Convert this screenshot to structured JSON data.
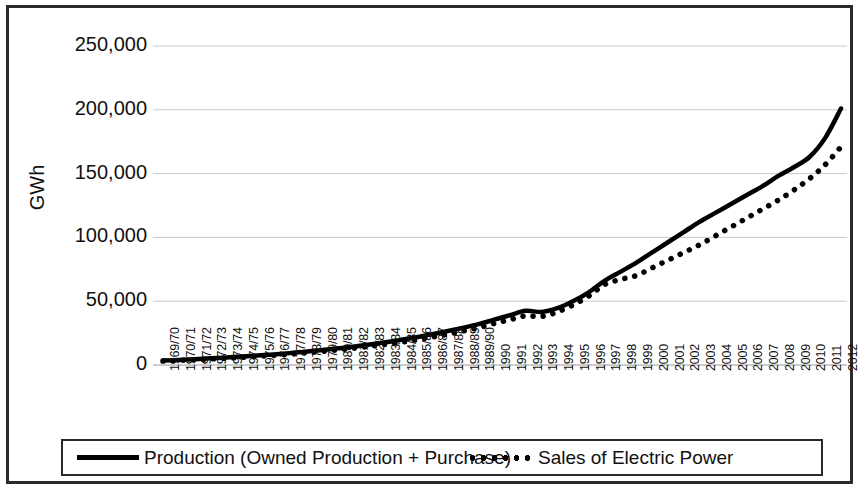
{
  "chart_data": {
    "type": "line",
    "title": "",
    "xlabel": "",
    "ylabel": "GWh",
    "ylim": [
      0,
      250000
    ],
    "yticks": [
      0,
      50000,
      100000,
      150000,
      200000,
      250000
    ],
    "ytick_labels": [
      "0",
      "50,000",
      "100,000",
      "150,000",
      "200,000",
      "250,000"
    ],
    "grid": true,
    "legend_position": "bottom",
    "categories": [
      "1969/70",
      "1970/71",
      "1971/72",
      "1972/73",
      "1973/74",
      "1974/75",
      "1975/76",
      "1976/77",
      "1977/78",
      "1978/79",
      "1979/80",
      "1980/81",
      "1981/82",
      "1982/83",
      "1983/84",
      "1984/85",
      "1985/86",
      "1986/87",
      "1987/88",
      "1988/89",
      "1989/90",
      "1990",
      "1991",
      "1992",
      "1993",
      "1994",
      "1995",
      "1996",
      "1997",
      "1998",
      "1999",
      "2000",
      "2001",
      "2002",
      "2003",
      "2004",
      "2005",
      "2006",
      "2007",
      "2008",
      "2009",
      "2010",
      "2011",
      "2012"
    ],
    "series": [
      {
        "name": "Production (Owned Production + Purchase)",
        "style": "solid",
        "color": "#000000",
        "values": [
          3500,
          4000,
          4600,
          5200,
          5900,
          6600,
          7400,
          8300,
          9300,
          10400,
          11600,
          12900,
          14300,
          15900,
          17600,
          19500,
          21600,
          23900,
          26400,
          29100,
          32000,
          35500,
          39000,
          42500,
          41500,
          44500,
          50000,
          57000,
          66000,
          73000,
          80000,
          88000,
          96000,
          104000,
          112000,
          119000,
          126000,
          133000,
          140000,
          148000,
          155000,
          163000,
          178000,
          201000
        ]
      },
      {
        "name": "Sales of Electric Power",
        "style": "dotted",
        "color": "#000000",
        "values": [
          3100,
          3600,
          4100,
          4700,
          5300,
          6000,
          6700,
          7500,
          8400,
          9400,
          10500,
          11700,
          13000,
          14400,
          16000,
          17700,
          19600,
          21700,
          24000,
          26500,
          29200,
          32500,
          35500,
          38500,
          38000,
          41500,
          47000,
          54000,
          63000,
          67000,
          70000,
          76000,
          82000,
          88000,
          94000,
          101000,
          108000,
          115000,
          122000,
          129000,
          137000,
          146000,
          157000,
          171000
        ]
      }
    ]
  },
  "legend": {
    "items": [
      {
        "label": "Production (Owned Production + Purchase)",
        "style": "solid"
      },
      {
        "label": "Sales of Electric Power",
        "style": "dotted"
      }
    ]
  },
  "axis": {
    "y_title": "GWh"
  }
}
